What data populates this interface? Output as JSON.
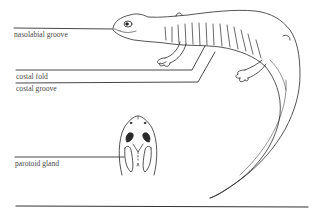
{
  "diagram": {
    "labels": {
      "nasolabial_groove": "nasolabial groove",
      "costal_fold": "costal fold",
      "costal_groove": "costal groove",
      "parotoid_gland": "parotoid gland"
    },
    "colors": {
      "line": "#2a2a2a",
      "text": "#4a4a4a",
      "background": "#ffffff"
    }
  }
}
